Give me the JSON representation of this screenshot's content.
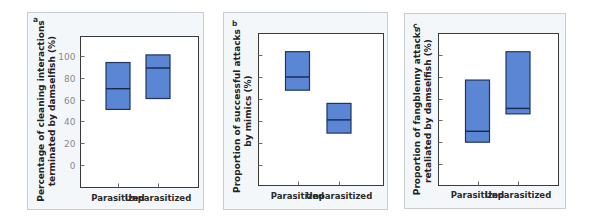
{
  "figure": {
    "colors": {
      "box_fill": "#5b86d4",
      "box_stroke": "#1f3560",
      "median": "#17294d"
    }
  },
  "chart_data": [
    {
      "type": "box",
      "panel": "a",
      "title": "",
      "xlabel": "",
      "ylabel_lines": [
        "Percentage of cleaning interactions",
        "terminated by damselfish (%)"
      ],
      "categories": [
        "Parasitized",
        "Unparasitized"
      ],
      "yticks": [
        0,
        20,
        40,
        60,
        80,
        100
      ],
      "ytick_labels_visible": true,
      "ylim": [
        -20,
        118
      ],
      "grid": false,
      "boxes": [
        {
          "category": "Parasitized",
          "q1": 51,
          "median": 70,
          "q3": 94
        },
        {
          "category": "Unparasitized",
          "q1": 61,
          "median": 89,
          "q3": 101
        }
      ]
    },
    {
      "type": "box",
      "panel": "b",
      "title": "",
      "xlabel": "",
      "ylabel_lines": [
        "Proportion of successful attacks",
        "by mimics (%)"
      ],
      "categories": [
        "Parasitized",
        "Unparasitized"
      ],
      "yticks": [
        0,
        20,
        40,
        60,
        80,
        100
      ],
      "ytick_labels_visible": false,
      "ylim": [
        -20,
        118
      ],
      "grid": false,
      "boxes": [
        {
          "category": "Parasitized",
          "q1": 68,
          "median": 80,
          "q3": 103
        },
        {
          "category": "Unparasitized",
          "q1": 29,
          "median": 41,
          "q3": 56
        }
      ]
    },
    {
      "type": "box",
      "panel": "c",
      "title": "",
      "xlabel": "",
      "ylabel_lines": [
        "Proportion of fangblenny attacks",
        "retaliated by damselfish (%)"
      ],
      "categories": [
        "Parasitized",
        "Unparasitized"
      ],
      "yticks": [
        0,
        20,
        40,
        60,
        80,
        100
      ],
      "ytick_labels_visible": false,
      "ylim": [
        -20,
        118
      ],
      "grid": false,
      "boxes": [
        {
          "category": "Parasitized",
          "q1": 20,
          "median": 30,
          "q3": 77
        },
        {
          "category": "Unparasitized",
          "q1": 46,
          "median": 51,
          "q3": 103
        }
      ]
    }
  ]
}
